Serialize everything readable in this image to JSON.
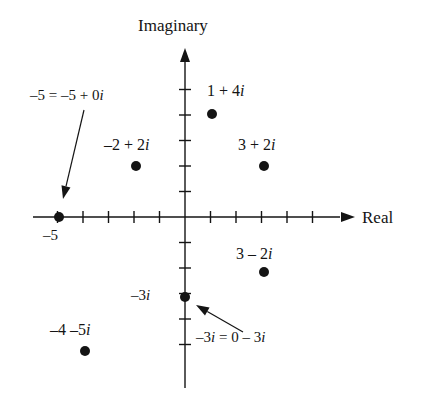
{
  "figure": {
    "title_axis_imaginary": "Imaginary",
    "title_axis_real": "Real",
    "background_color": "#ffffff",
    "ink_color": "#141414"
  },
  "axes": {
    "imaginary_label": "Imaginary",
    "real_label": "Real",
    "origin_px": {
      "x": 185,
      "y": 217
    },
    "unit_px": 25.5,
    "real_range": [
      -6,
      6
    ],
    "imaginary_range": [
      -6,
      6
    ],
    "real_ticks": [
      -5,
      -4,
      -3,
      -2,
      -1,
      1,
      2,
      3,
      4,
      5
    ],
    "imaginary_ticks": [
      -5,
      -4,
      -3,
      -2,
      -1,
      1,
      2,
      3,
      4,
      5
    ]
  },
  "tick_labels": [
    {
      "text": "–5",
      "axis": "real",
      "value": -5,
      "x": 43,
      "y": 228
    },
    {
      "text": "–3i",
      "axis": "imaginary",
      "value": -3,
      "x": 131,
      "y": 288
    }
  ],
  "points": [
    {
      "id": "p-neg5",
      "label": "",
      "re": -5,
      "im": 0,
      "x": 59,
      "y": 217
    },
    {
      "id": "p-neg2plus2i",
      "label": "–2 + 2i",
      "re": -2,
      "im": 2,
      "x": 136,
      "y": 166
    },
    {
      "id": "p-1plus4i",
      "label": "1 + 4i",
      "re": 1,
      "im": 4,
      "x": 212,
      "y": 114
    },
    {
      "id": "p-3plus2i",
      "label": "3 + 2i",
      "re": 3,
      "im": 2,
      "x": 264,
      "y": 166
    },
    {
      "id": "p-3minus2i",
      "label": "3 – 2i",
      "re": 3,
      "im": -2,
      "x": 264,
      "y": 272
    },
    {
      "id": "p-neg3i",
      "label": "",
      "re": 0,
      "im": -3,
      "x": 185,
      "y": 297
    },
    {
      "id": "p-neg4minus5i",
      "label": "–4 –5i",
      "re": -4,
      "im": -5,
      "x": 85,
      "y": 351
    }
  ],
  "point_labels": [
    {
      "id": "lbl-1plus4i",
      "text": "1 + 4i",
      "x": 207,
      "y": 83,
      "italic_tail": "i"
    },
    {
      "id": "lbl-neg2plus2i",
      "text": "–2 + 2i",
      "x": 104,
      "y": 137
    },
    {
      "id": "lbl-3plus2i",
      "text": "3 + 2i",
      "x": 238,
      "y": 137
    },
    {
      "id": "lbl-3minus2i",
      "text": "3 – 2i",
      "x": 236,
      "y": 246
    },
    {
      "id": "lbl-neg4minus5i",
      "text": "–4 –5i",
      "x": 50,
      "y": 322
    }
  ],
  "annotations": [
    {
      "id": "annot-neg5",
      "text": "–5 = –5 + 0i",
      "text_x": 30,
      "text_y": 88,
      "arrow": {
        "x1": 84,
        "y1": 110,
        "x2": 63,
        "y2": 199
      }
    },
    {
      "id": "annot-neg3i",
      "text": "–3i = 0 – 3i",
      "text_x": 196,
      "text_y": 330,
      "arrow": {
        "x1": 243,
        "y1": 332,
        "x2": 196,
        "y2": 305
      }
    }
  ],
  "style": {
    "point_radius": 5,
    "axis_stroke": 1.4,
    "tick_half_len": 6
  }
}
